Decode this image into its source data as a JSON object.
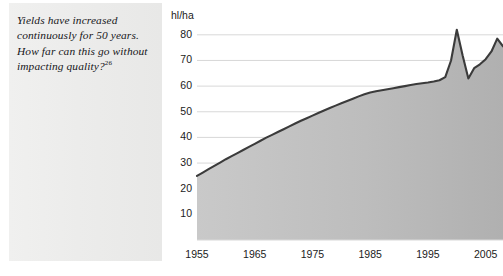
{
  "caption": {
    "text": "Yields have increased continuously for 50 years. How far can this go without impacting quality?",
    "footnote_marker": "26"
  },
  "chart_data": {
    "type": "area",
    "title": "",
    "xlabel": "",
    "ylabel": "hl/ha",
    "unit_label": "hl/ha",
    "xlim": [
      1955,
      2008
    ],
    "ylim": [
      0,
      85
    ],
    "yticks": [
      10,
      20,
      30,
      40,
      50,
      60,
      70,
      80
    ],
    "xticks": [
      1955,
      1965,
      1975,
      1985,
      1995,
      2005
    ],
    "grid": true,
    "legend": false,
    "line_color": "#3b3b3b",
    "fill_color": "#b8b8b8",
    "x": [
      1955,
      1956,
      1957,
      1958,
      1959,
      1960,
      1961,
      1962,
      1963,
      1964,
      1965,
      1966,
      1967,
      1968,
      1969,
      1970,
      1971,
      1972,
      1973,
      1974,
      1975,
      1976,
      1977,
      1978,
      1979,
      1980,
      1981,
      1982,
      1983,
      1984,
      1985,
      1986,
      1987,
      1988,
      1989,
      1990,
      1991,
      1992,
      1993,
      1994,
      1995,
      1996,
      1997,
      1998,
      1999,
      2000,
      2001,
      2002,
      2003,
      2004,
      2005,
      2006,
      2007,
      2008
    ],
    "values": [
      25.0,
      26.3,
      27.6,
      28.9,
      30.2,
      31.5,
      32.7,
      33.9,
      35.1,
      36.3,
      37.5,
      38.7,
      39.9,
      41.0,
      42.1,
      43.2,
      44.3,
      45.4,
      46.5,
      47.5,
      48.5,
      49.5,
      50.5,
      51.5,
      52.4,
      53.3,
      54.2,
      55.1,
      56.0,
      56.8,
      57.5,
      58.0,
      58.4,
      58.8,
      59.2,
      59.6,
      60.0,
      60.4,
      60.8,
      61.1,
      61.4,
      61.8,
      62.3,
      63.5,
      70.0,
      82.0,
      72.0,
      63.0,
      67.0,
      68.5,
      70.5,
      73.5,
      78.5,
      75.5
    ]
  }
}
